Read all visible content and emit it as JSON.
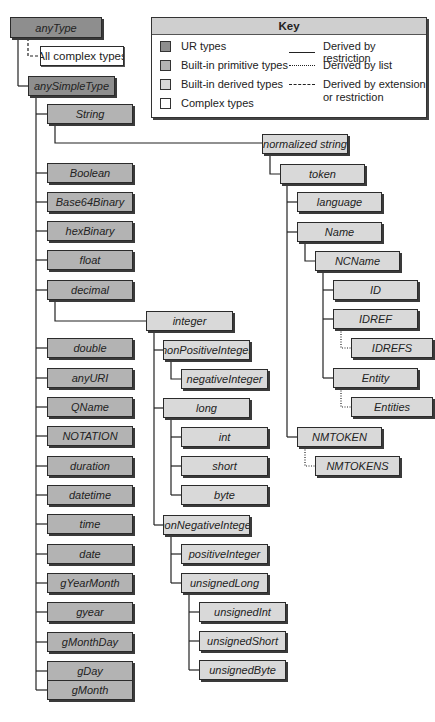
{
  "key": {
    "title": "Key",
    "type_legend": [
      {
        "label": "UR types",
        "color": "#8e8e8e"
      },
      {
        "label": "Built-in primitive types",
        "color": "#b3b3b3"
      },
      {
        "label": "Built-in derived types",
        "color": "#d9d9d9"
      },
      {
        "label": "Complex types",
        "color": "#ffffff"
      }
    ],
    "line_legend": [
      {
        "label": "Derived by restriction",
        "style": "solid"
      },
      {
        "label": "Derived by list",
        "style": "dotted"
      },
      {
        "label": "Derived by extension",
        "label2": "or restriction",
        "style": "dashed"
      }
    ]
  },
  "nodes": {
    "anyType": "anyType",
    "allComplex": "All complex types",
    "anySimpleType": "anySimpleType",
    "string": "String",
    "normalizedString": "normalized string",
    "token": "token",
    "language": "language",
    "name": "Name",
    "ncname": "NCName",
    "id": "ID",
    "idref": "IDREF",
    "idrefs": "IDREFS",
    "entity": "Entity",
    "entities": "Entities",
    "nmtoken": "NMTOKEN",
    "nmtokens": "NMTOKENS",
    "boolean": "Boolean",
    "base64": "Base64Binary",
    "hexBinary": "hexBinary",
    "float": "float",
    "decimal": "decimal",
    "integer": "integer",
    "nonPositiveInteger": "nonPositiveInteger",
    "negativeInteger": "negativeInteger",
    "long": "long",
    "int": "int",
    "short": "short",
    "byte": "byte",
    "nonNegativeInteger": "nonNegativeInteger",
    "positiveInteger": "positiveInteger",
    "unsignedLong": "unsignedLong",
    "unsignedInt": "unsignedInt",
    "unsignedShort": "unsignedShort",
    "unsignedByte": "unsignedByte",
    "double": "double",
    "anyURI": "anyURI",
    "qname": "QName",
    "notation": "NOTATION",
    "duration": "duration",
    "datetime": "datetime",
    "time": "time",
    "date": "date",
    "gYearMonth": "gYearMonth",
    "gyear": "gyear",
    "gMonthDay": "gMonthDay",
    "gDay": "gDay",
    "gMonth": "gMonth"
  }
}
